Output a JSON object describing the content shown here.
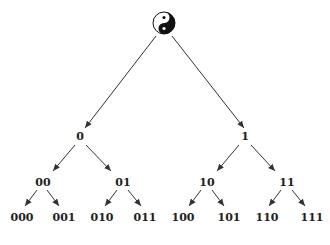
{
  "diagram": {
    "root": {
      "symbol": "yin-yang-icon",
      "x": 164,
      "y": 23,
      "r": 11
    },
    "colors": {
      "line": "#333333",
      "text": "#222222",
      "background": "#ffffff"
    },
    "nodes": [
      {
        "id": "0",
        "label": "0",
        "x": 80,
        "y": 140
      },
      {
        "id": "1",
        "label": "1",
        "x": 245,
        "y": 140
      },
      {
        "id": "00",
        "label": "00",
        "x": 43,
        "y": 186
      },
      {
        "id": "01",
        "label": "01",
        "x": 123,
        "y": 186
      },
      {
        "id": "10",
        "label": "10",
        "x": 207,
        "y": 186
      },
      {
        "id": "11",
        "label": "11",
        "x": 287,
        "y": 186
      },
      {
        "id": "000",
        "label": "000",
        "x": 22,
        "y": 221
      },
      {
        "id": "001",
        "label": "001",
        "x": 64,
        "y": 221
      },
      {
        "id": "010",
        "label": "010",
        "x": 102,
        "y": 221
      },
      {
        "id": "011",
        "label": "011",
        "x": 145,
        "y": 221
      },
      {
        "id": "100",
        "label": "100",
        "x": 183,
        "y": 221
      },
      {
        "id": "101",
        "label": "101",
        "x": 229,
        "y": 221
      },
      {
        "id": "110",
        "label": "110",
        "x": 267,
        "y": 221
      },
      {
        "id": "111",
        "label": "111",
        "x": 312,
        "y": 221
      }
    ],
    "edges": [
      {
        "from": "root",
        "to": "0",
        "x1": 156,
        "y1": 36,
        "x2": 85,
        "y2": 128
      },
      {
        "from": "root",
        "to": "1",
        "x1": 172,
        "y1": 36,
        "x2": 244,
        "y2": 128
      },
      {
        "from": "0",
        "to": "00",
        "x1": 75,
        "y1": 145,
        "x2": 53,
        "y2": 171
      },
      {
        "from": "0",
        "to": "01",
        "x1": 86,
        "y1": 145,
        "x2": 111,
        "y2": 171
      },
      {
        "from": "1",
        "to": "10",
        "x1": 239,
        "y1": 145,
        "x2": 217,
        "y2": 171
      },
      {
        "from": "1",
        "to": "11",
        "x1": 251,
        "y1": 145,
        "x2": 275,
        "y2": 171
      },
      {
        "from": "00",
        "to": "000",
        "x1": 37,
        "y1": 190,
        "x2": 25,
        "y2": 206
      },
      {
        "from": "00",
        "to": "001",
        "x1": 47,
        "y1": 190,
        "x2": 59,
        "y2": 206
      },
      {
        "from": "01",
        "to": "010",
        "x1": 117,
        "y1": 190,
        "x2": 105,
        "y2": 206
      },
      {
        "from": "01",
        "to": "011",
        "x1": 128,
        "y1": 190,
        "x2": 141,
        "y2": 206
      },
      {
        "from": "10",
        "to": "100",
        "x1": 201,
        "y1": 190,
        "x2": 189,
        "y2": 206
      },
      {
        "from": "10",
        "to": "101",
        "x1": 212,
        "y1": 190,
        "x2": 224,
        "y2": 206
      },
      {
        "from": "11",
        "to": "110",
        "x1": 281,
        "y1": 190,
        "x2": 269,
        "y2": 206
      },
      {
        "from": "11",
        "to": "111",
        "x1": 292,
        "y1": 190,
        "x2": 305,
        "y2": 206
      }
    ]
  }
}
